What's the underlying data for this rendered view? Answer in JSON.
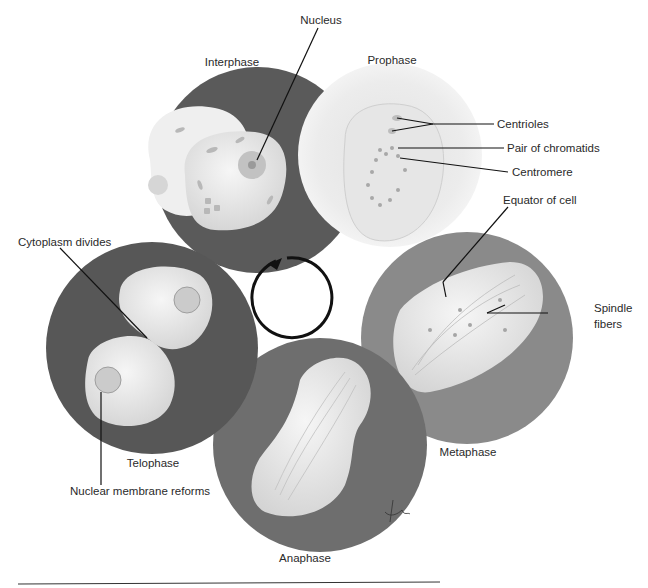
{
  "diagram": {
    "colors": {
      "background": "#ffffff",
      "interphase_disc": "#5a5a5a",
      "prophase_disc": "#ececec",
      "metaphase_disc": "#8a8a8a",
      "anaphase_disc": "#6e6e6e",
      "telophase_disc": "#575757",
      "cell_fill": "#e8e8e8",
      "leader_line": "#111111",
      "cycle_arrow": "#111111"
    },
    "phases": [
      {
        "id": "interphase",
        "label": "Interphase"
      },
      {
        "id": "prophase",
        "label": "Prophase"
      },
      {
        "id": "metaphase",
        "label": "Metaphase"
      },
      {
        "id": "anaphase",
        "label": "Anaphase"
      },
      {
        "id": "telophase",
        "label": "Telophase"
      }
    ],
    "callouts": {
      "nucleus": "Nucleus",
      "centrioles": "Centrioles",
      "pair_of_chromatids": "Pair of chromatids",
      "centromere": "Centromere",
      "equator_of_cell": "Equator of cell",
      "spindle_fibers_line1": "Spindle",
      "spindle_fibers_line2": "fibers",
      "cytoplasm_divides": "Cytoplasm divides",
      "nuclear_membrane_reforms": "Nuclear membrane reforms"
    },
    "center_icon": "cycle-arrow-icon",
    "signature_icon": "artist-signature-icon"
  }
}
